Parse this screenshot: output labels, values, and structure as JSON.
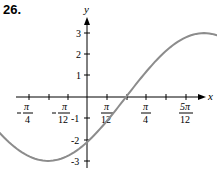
{
  "problem_number": "26.",
  "axes": {
    "x_label": "x",
    "y_label": "y"
  },
  "y_ticks": [
    "3",
    "2",
    "1",
    "-1",
    "-2",
    "-3"
  ],
  "x_tick_labels": [
    {
      "num": "π",
      "den": "4",
      "neg": true
    },
    {
      "num": "π",
      "den": "12",
      "neg": true
    },
    {
      "num": "π",
      "den": "12",
      "neg": false
    },
    {
      "num": "π",
      "den": "4",
      "neg": false
    },
    {
      "num": "5π",
      "den": "12",
      "neg": false
    }
  ],
  "colors": {
    "curve": "#8c8c8c",
    "axis": "#000000"
  },
  "chart_data": {
    "type": "line",
    "title": "26.",
    "function": "y = 3 sin(3x - π/4)",
    "xlabel": "x",
    "ylabel": "y",
    "x_tick_labels": [
      "-π/4",
      "-π/12",
      "π/12",
      "π/4",
      "5π/12"
    ],
    "y_tick_labels": [
      "-3",
      "-2",
      "-1",
      "1",
      "2",
      "3"
    ],
    "xlim": [
      -0.785,
      1.309
    ],
    "ylim": [
      -3,
      3
    ],
    "x": [
      -0.7854,
      -0.5236,
      -0.2618,
      0,
      0.2618,
      0.5236,
      0.7854,
      1.0472,
      1.309
    ],
    "x_labels": [
      "-π/4",
      "-π/6",
      "-π/12",
      "0",
      "π/12",
      "π/6",
      "π/4",
      "π/3",
      "5π/12"
    ],
    "values": [
      0,
      -2.12,
      -3,
      -2.12,
      0,
      2.12,
      3,
      2.12,
      0
    ],
    "key_points": [
      {
        "x": "-π/4",
        "y": 0
      },
      {
        "x": "-π/12",
        "y": -3
      },
      {
        "x": "π/12",
        "y": 0
      },
      {
        "x": "π/4",
        "y": 3
      },
      {
        "x": "5π/12",
        "y": 0
      }
    ],
    "grid": false
  }
}
